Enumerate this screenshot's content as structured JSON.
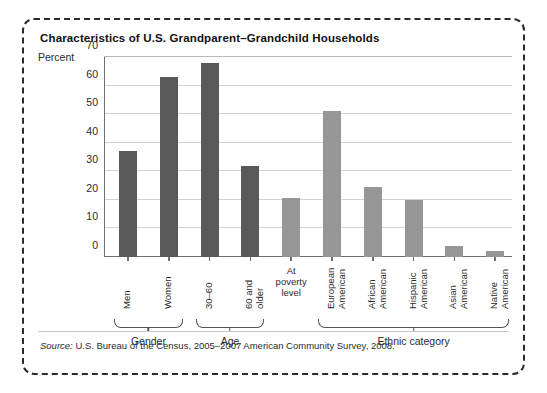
{
  "figure": {
    "title": "Characteristics of U.S. Grandparent–Grandchild Households",
    "source_word": "Source:",
    "source_text": " U.S. Bureau of the Census, 2005–2007 American Community Survey, 2008."
  },
  "colors": {
    "dark_bar": "#595959",
    "light_bar": "#969696",
    "axis": "#6f6f6f",
    "gridline": "#d2d2d2",
    "border": "#2b2b2b"
  },
  "chart_data": {
    "type": "bar",
    "title": "Characteristics of U.S. Grandparent–Grandchild Households",
    "xlabel": "",
    "ylabel": "Percent",
    "ylim": [
      0,
      70
    ],
    "yticks": [
      0,
      10,
      20,
      30,
      40,
      50,
      60,
      70
    ],
    "ytick_labels": [
      "0",
      "10",
      "20",
      "30",
      "40",
      "50",
      "60",
      "70"
    ],
    "grid": true,
    "legend": "none",
    "categories": [
      "Men",
      "Women",
      "30–60",
      "60 and older",
      "At poverty level",
      "European American",
      "African American",
      "Hispanic American",
      "Asian American",
      "Native American"
    ],
    "values": [
      37,
      63,
      68,
      32,
      20.5,
      51,
      24.5,
      20,
      4,
      2
    ],
    "bar_colors": [
      "#595959",
      "#595959",
      "#595959",
      "#595959",
      "#969696",
      "#969696",
      "#969696",
      "#969696",
      "#969696",
      "#969696"
    ],
    "label_lines": [
      [
        "Men"
      ],
      [
        "Women"
      ],
      [
        "30–60"
      ],
      [
        "60 and",
        "older"
      ],
      [
        "At",
        "poverty",
        "level"
      ],
      [
        "European",
        "American"
      ],
      [
        "African",
        "American"
      ],
      [
        "Hispanic",
        "American"
      ],
      [
        "Asian",
        "American"
      ],
      [
        "Native",
        "American"
      ]
    ],
    "label_orientation": [
      "rotated",
      "rotated",
      "rotated",
      "rotated",
      "horizontal",
      "rotated",
      "rotated",
      "rotated",
      "rotated",
      "rotated"
    ],
    "groups": [
      {
        "label": "Gender",
        "first": 0,
        "last": 1
      },
      {
        "label": "Age",
        "first": 2,
        "last": 3
      },
      {
        "label": "Ethnic category",
        "first": 5,
        "last": 9
      }
    ]
  }
}
